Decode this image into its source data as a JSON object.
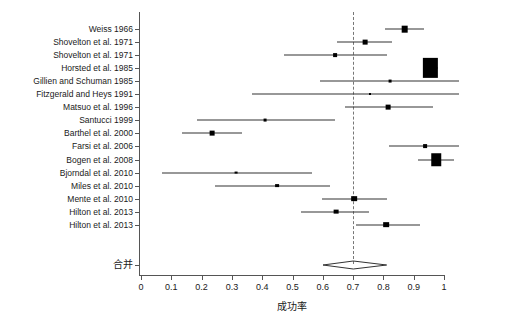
{
  "chart_data": {
    "type": "forest",
    "title": "",
    "xlabel": "成功率",
    "ylabel": "",
    "xlim": [
      0,
      1.05
    ],
    "xticks": [
      0,
      0.1,
      0.2,
      0.3,
      0.4,
      0.5,
      0.6,
      0.7,
      0.8,
      0.9,
      1
    ],
    "xticklabels": [
      "0",
      "0.1",
      "0.2",
      "0.3",
      "0.4",
      "0.5",
      "0.6",
      "0.7",
      "0.8",
      "0.9",
      "1"
    ],
    "reference_line": 0.7,
    "grid": false,
    "legend": "none",
    "summary_label": "合并",
    "summary": {
      "estimate": 0.7,
      "ci_low": 0.6,
      "ci_high": 0.81
    },
    "categories": [
      "Weiss 1966",
      "Shovelton et al. 1971",
      "Shovelton et al. 1971",
      "Horsted et al. 1985",
      "Gillien and Schuman 1985",
      "Fitzgerald and Heys 1991",
      "Matsuo et al. 1996",
      "Santucci 1999",
      "Barthel et al. 2000",
      "Farsi et al. 2006",
      "Bogen et al. 2008",
      "Bjorndal et al. 2010",
      "Miles et al. 2010",
      "Mente et al. 2010",
      "Hilton et al. 2013",
      "Hilton et al. 2013"
    ],
    "studies": [
      {
        "label": "Weiss 1966",
        "estimate": 0.87,
        "ci_low": 0.805,
        "ci_high": 0.935,
        "weight": 7
      },
      {
        "label": "Shovelton et al. 1971",
        "estimate": 0.74,
        "ci_low": 0.648,
        "ci_high": 0.828,
        "weight": 5
      },
      {
        "label": "Shovelton et al. 1971",
        "estimate": 0.64,
        "ci_low": 0.472,
        "ci_high": 0.812,
        "weight": 4
      },
      {
        "label": "Horsted et al. 1985",
        "estimate": 0.955,
        "ci_low": 0.93,
        "ci_high": 0.98,
        "weight": 15
      },
      {
        "label": "Gillien and Schuman 1985",
        "estimate": 0.822,
        "ci_low": 0.591,
        "ci_high": 1.05,
        "weight": 3
      },
      {
        "label": "Fitzgerald and Heys 1991",
        "estimate": 0.755,
        "ci_low": 0.366,
        "ci_high": 1.05,
        "weight": 2
      },
      {
        "label": "Matsuo et al. 1996",
        "estimate": 0.815,
        "ci_low": 0.673,
        "ci_high": 0.964,
        "weight": 5
      },
      {
        "label": "Santucci 1999",
        "estimate": 0.409,
        "ci_low": 0.185,
        "ci_high": 0.64,
        "weight": 3
      },
      {
        "label": "Barthel et al. 2000",
        "estimate": 0.234,
        "ci_low": 0.135,
        "ci_high": 0.333,
        "weight": 5
      },
      {
        "label": "Farsi et al. 2006",
        "estimate": 0.937,
        "ci_low": 0.818,
        "ci_high": 1.05,
        "weight": 4
      },
      {
        "label": "Bogen et al. 2008",
        "estimate": 0.974,
        "ci_low": 0.914,
        "ci_high": 1.033,
        "weight": 10
      },
      {
        "label": "Bjorndal et al. 2010",
        "estimate": 0.313,
        "ci_low": 0.069,
        "ci_high": 0.564,
        "weight": 3
      },
      {
        "label": "Miles et al. 2010",
        "estimate": 0.449,
        "ci_low": 0.244,
        "ci_high": 0.624,
        "weight": 4
      },
      {
        "label": "Mente et al. 2010",
        "estimate": 0.703,
        "ci_low": 0.597,
        "ci_high": 0.812,
        "weight": 6
      },
      {
        "label": "Hilton et al. 2013",
        "estimate": 0.644,
        "ci_low": 0.528,
        "ci_high": 0.753,
        "weight": 5
      },
      {
        "label": "Hilton et al. 2013",
        "estimate": 0.809,
        "ci_low": 0.709,
        "ci_high": 0.921,
        "weight": 6
      }
    ]
  },
  "colors": {
    "marker": "#000000",
    "line": "#333333",
    "axis": "#555555",
    "reference": "#777777",
    "background": "#ffffff"
  }
}
